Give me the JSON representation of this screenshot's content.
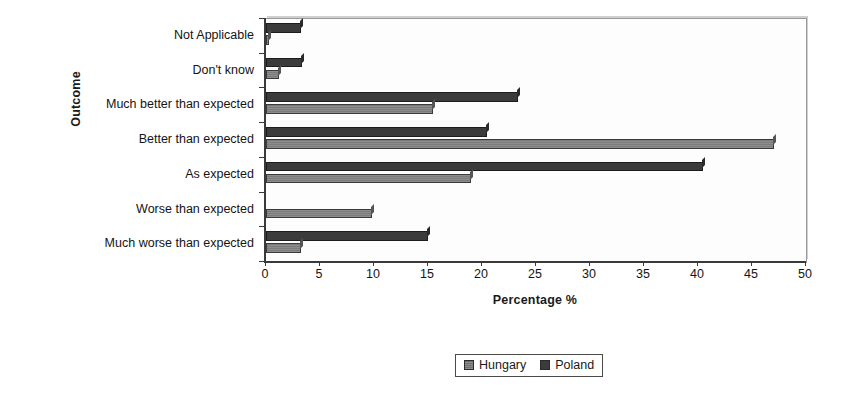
{
  "chart_data": {
    "type": "bar",
    "orientation": "horizontal",
    "title": "",
    "xlabel": "Percentage %",
    "ylabel": "Outcome",
    "xlim": [
      0,
      50
    ],
    "xticks": [
      0,
      5,
      10,
      15,
      20,
      25,
      30,
      35,
      40,
      45,
      50
    ],
    "xtick_labels": [
      "0",
      "5",
      "10",
      "15",
      "20",
      "25",
      "30",
      "35",
      "40",
      "45",
      "50"
    ],
    "grid": false,
    "legend_position": "bottom",
    "categories": [
      "Not Applicable",
      "Don't know",
      "Much better than expected",
      "Better than expected",
      "As expected",
      "Worse than expected",
      "Much worse than expected"
    ],
    "series": [
      {
        "name": "Hungary",
        "color": "#7b7b7b",
        "values": [
          0.3,
          1.2,
          15.5,
          47.0,
          19.0,
          9.8,
          3.2
        ]
      },
      {
        "name": "Poland",
        "color": "#3b3b3b",
        "values": [
          3.2,
          3.3,
          23.3,
          20.5,
          40.5,
          0.0,
          15.0
        ]
      }
    ]
  },
  "legend": {
    "items": [
      {
        "label": "Hungary"
      },
      {
        "label": "Poland"
      }
    ]
  }
}
